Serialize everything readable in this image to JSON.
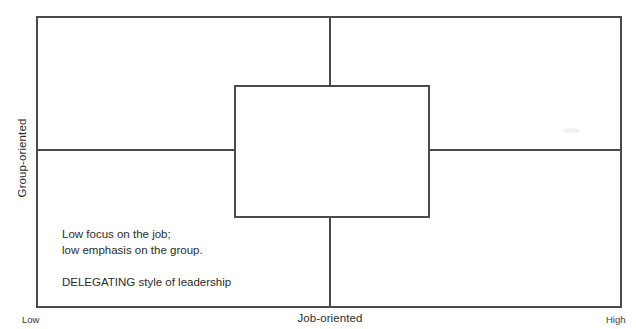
{
  "diagram": {
    "axes": {
      "y_label": "Group-oriented",
      "x_label": "Job-oriented",
      "x_min_label": "Low",
      "x_max_label": "High"
    },
    "quadrant": {
      "description_line_1": "Low focus on the job;",
      "description_line_2": "low emphasis on the group.",
      "style_line": "DELEGATING style of leadership"
    },
    "colors": {
      "line": "#4a4a4c",
      "text": "#2b2b2b",
      "background": "#ffffff"
    }
  }
}
